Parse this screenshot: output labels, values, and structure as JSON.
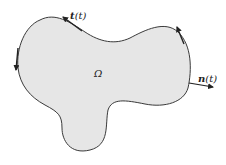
{
  "figure": {
    "region_label": "Ω",
    "tangent_label_bold": "t",
    "tangent_label_arg": "(t)",
    "normal_label_bold": "n",
    "normal_label_arg": "(t)",
    "colors": {
      "fill": "#e6e6e6",
      "stroke": "#3a3a3a",
      "text": "#222222"
    }
  }
}
